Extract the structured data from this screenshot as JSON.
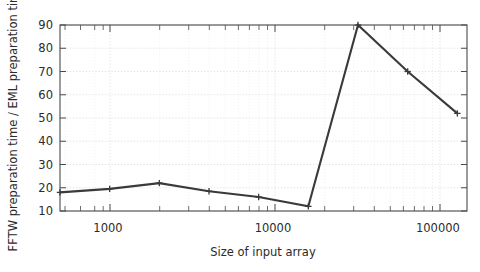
{
  "chart_data": {
    "type": "line",
    "title": "",
    "xlabel": "Size of input array",
    "ylabel": "FFTW preparation time / EML preparation time",
    "xscale": "log",
    "yscale": "linear",
    "xlim": [
      512,
      150000
    ],
    "ylim": [
      10,
      90
    ],
    "grid": true,
    "legend": false,
    "xticks": [
      1000,
      10000,
      100000
    ],
    "xticklabels": [
      "1000",
      "10000",
      "100000"
    ],
    "yticks": [
      10,
      20,
      30,
      40,
      50,
      60,
      70,
      80,
      90
    ],
    "yticklabels": [
      "10",
      "20",
      "30",
      "40",
      "50",
      "60",
      "70",
      "80",
      "90"
    ],
    "series": [
      {
        "name": "FFTW / EML preparation time ratio",
        "color": "#3a3a3a",
        "marker": "plus",
        "x": [
          512,
          1024,
          2048,
          4096,
          8192,
          16384,
          32768,
          65536,
          131072
        ],
        "y": [
          18,
          19.5,
          22,
          18.5,
          16,
          12,
          90,
          70,
          52
        ]
      }
    ]
  },
  "axes": {
    "x_axis_label": "Size of input array",
    "y_axis_label": "FFTW preparation time / EML preparation time"
  }
}
